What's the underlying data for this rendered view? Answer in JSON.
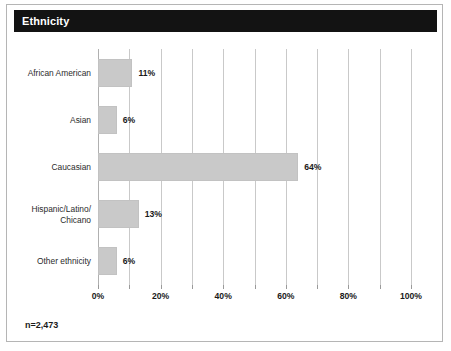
{
  "header": {
    "title": "Ethnicity"
  },
  "footnote": "n=2,473",
  "chart_data": {
    "type": "bar",
    "orientation": "horizontal",
    "title": "Ethnicity",
    "xlabel": "",
    "ylabel": "",
    "categories": [
      "African American",
      "Asian",
      "Caucasian",
      "Hispanic/Latino/\nChicano",
      "Other ethnicity"
    ],
    "values": [
      11,
      6,
      64,
      13,
      6
    ],
    "value_labels": [
      "11%",
      "6%",
      "64%",
      "13%",
      "6%"
    ],
    "xlim": [
      0,
      100
    ],
    "xticks": [
      0,
      10,
      20,
      30,
      40,
      50,
      60,
      70,
      80,
      90,
      100
    ],
    "xtick_labels_shown": [
      {
        "value": 0,
        "label": "0%"
      },
      {
        "value": 20,
        "label": "20%"
      },
      {
        "value": 40,
        "label": "40%"
      },
      {
        "value": 60,
        "label": "60%"
      },
      {
        "value": 80,
        "label": "80%"
      },
      {
        "value": 100,
        "label": "100%"
      }
    ],
    "grid": true,
    "legend": false,
    "sample_size": "n=2,473",
    "colors": {
      "bar_fill": "#C9C9C9",
      "bar_edge": "#C2C2C2",
      "gridline": "#C9C9C9",
      "header_background": "#131313",
      "header_text": "#FFFFFF",
      "text": "#1A1A1A",
      "figure_border": "#B5B5B5"
    }
  }
}
